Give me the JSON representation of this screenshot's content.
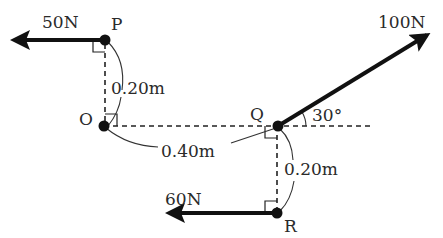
{
  "diagram": {
    "type": "force-diagram",
    "points": [
      {
        "name": "P",
        "label": "P",
        "x": 105,
        "y": 40
      },
      {
        "name": "O",
        "label": "O",
        "x": 104,
        "y": 126
      },
      {
        "name": "Q",
        "label": "Q",
        "x": 278,
        "y": 126
      },
      {
        "name": "R",
        "label": "R",
        "x": 277,
        "y": 213
      }
    ],
    "forces": [
      {
        "name": "force-P",
        "label": "50N",
        "at": "P",
        "direction": "left"
      },
      {
        "name": "force-Q",
        "label": "100N",
        "at": "Q",
        "direction": "up-right",
        "angle_deg": 30
      },
      {
        "name": "force-R",
        "label": "60N",
        "at": "R",
        "direction": "left"
      }
    ],
    "dimensions": {
      "OP": "0.20m",
      "OQ": "0.40m",
      "QR": "0.20m"
    },
    "angle_label": "30°"
  }
}
